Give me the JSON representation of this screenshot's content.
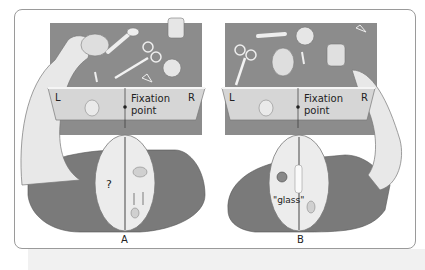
{
  "figure": {
    "panels": [
      {
        "id": "A",
        "caption": "A",
        "screen": {
          "left_label": "L",
          "right_label": "R",
          "fixation_text_line1": "Fixation",
          "fixation_text_line2": "point"
        },
        "brain_label": "?"
      },
      {
        "id": "B",
        "caption": "B",
        "screen": {
          "left_label": "L",
          "right_label": "R",
          "fixation_text_line1": "Fixation",
          "fixation_text_line2": "point"
        },
        "brain_label": "\"glass\""
      }
    ],
    "colors": {
      "table": "#8c8c8c",
      "screen": "#d6d6d6",
      "shirt": "#7a7a7a",
      "skin": "#e8e8e8",
      "border": "#9a9a9a"
    }
  }
}
